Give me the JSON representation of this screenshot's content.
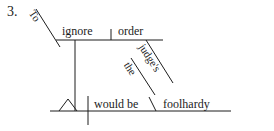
{
  "page": {
    "background_color": "#ffffff",
    "ink_color": "#1c1c1c",
    "type": "reed-kellogg-sentence-diagram"
  },
  "item": {
    "number_label": "3."
  },
  "diagram": {
    "sentence": "To ignore the judge's order would be foolhardy",
    "words": {
      "infinitive_marker": "To",
      "infinitive_verb": "ignore",
      "direct_object": "order",
      "possessive_modifier": "judge's",
      "article_modifier": "the",
      "verb_phrase": "would be",
      "predicate_adjective": "foolhardy"
    },
    "labels": [
      {
        "id": "to",
        "text": "To",
        "orientation": "diagonal"
      },
      {
        "id": "ignore",
        "text": "ignore",
        "orientation": "horizontal"
      },
      {
        "id": "order",
        "text": "order",
        "orientation": "horizontal"
      },
      {
        "id": "judges",
        "text": "judge's",
        "orientation": "diagonal"
      },
      {
        "id": "the",
        "text": "the",
        "orientation": "diagonal"
      },
      {
        "id": "would-be",
        "text": "would be",
        "orientation": "horizontal"
      },
      {
        "id": "foolhardy",
        "text": "foolhardy",
        "orientation": "horizontal"
      }
    ],
    "subject_placeholder": "empty-triangle"
  }
}
